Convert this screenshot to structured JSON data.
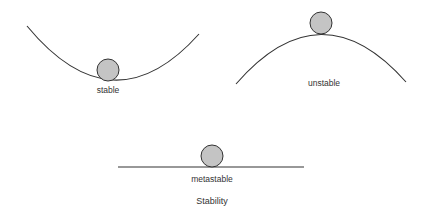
{
  "diagram": {
    "title": "Stability",
    "states": [
      {
        "id": "stable",
        "label": "stable"
      },
      {
        "id": "unstable",
        "label": "unstable"
      },
      {
        "id": "metastable",
        "label": "metastable"
      }
    ],
    "colors": {
      "ball_fill": "#c4c4c4",
      "ball_stroke": "#333333",
      "line": "#333333",
      "text": "#333333"
    }
  }
}
